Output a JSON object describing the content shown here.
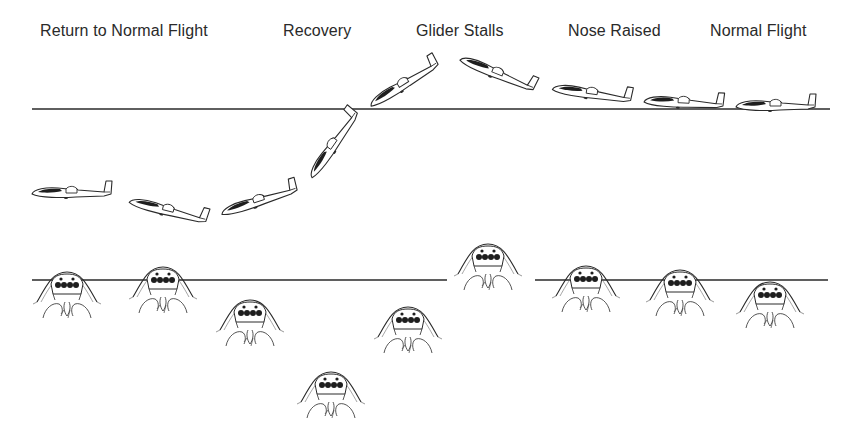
{
  "diagram": {
    "type": "glider-stall-sequence",
    "phase_labels": [
      {
        "id": "return",
        "text": "Return to Normal Flight",
        "x": 40
      },
      {
        "id": "recovery",
        "text": "Recovery",
        "x": 283
      },
      {
        "id": "stall",
        "text": "Glider Stalls",
        "x": 416
      },
      {
        "id": "nose-raised",
        "text": "Nose Raised",
        "x": 568
      },
      {
        "id": "normal",
        "text": "Normal Flight",
        "x": 710
      }
    ],
    "horizon_upper": {
      "y": 109,
      "x1": 32,
      "x2": 830
    },
    "horizon_lower": {
      "y": 280,
      "segments": [
        [
          32,
          447
        ],
        [
          535,
          828
        ]
      ]
    },
    "gliders": [
      {
        "x": 776,
        "y": 107,
        "angle": 0
      },
      {
        "x": 684,
        "y": 104,
        "angle": 3
      },
      {
        "x": 592,
        "y": 95,
        "angle": 8
      },
      {
        "x": 497,
        "y": 75,
        "angle": 22
      },
      {
        "x": 405,
        "y": 85,
        "angle": -32
      },
      {
        "x": 335,
        "y": 145,
        "angle": -55
      },
      {
        "x": 260,
        "y": 202,
        "angle": -18
      },
      {
        "x": 168,
        "y": 212,
        "angle": 14
      },
      {
        "x": 72,
        "y": 194,
        "angle": 0
      }
    ],
    "cockpit_views": [
      {
        "x": 770,
        "y": 300
      },
      {
        "x": 680,
        "y": 288
      },
      {
        "x": 586,
        "y": 284
      },
      {
        "x": 488,
        "y": 262
      },
      {
        "x": 408,
        "y": 325
      },
      {
        "x": 331,
        "y": 390
      },
      {
        "x": 250,
        "y": 318
      },
      {
        "x": 163,
        "y": 285
      },
      {
        "x": 67,
        "y": 290
      }
    ],
    "colors": {
      "ink": "#2a2a2a",
      "background": "#ffffff",
      "canopy": "#1e1e1e"
    }
  }
}
